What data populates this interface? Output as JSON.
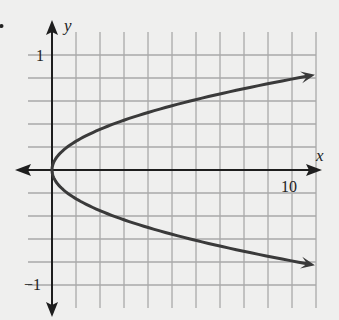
{
  "chart_data": {
    "type": "line",
    "title": "",
    "xlabel": "x",
    "ylabel": "y",
    "equation": "x = 16y^2",
    "xlim": [
      -1,
      11
    ],
    "ylim": [
      -1.2,
      1.2
    ],
    "grid": true,
    "x_grid_step": 1,
    "y_grid_step": 0.2,
    "tick_labels": {
      "x": [
        {
          "value": 10,
          "label": "10"
        }
      ],
      "y": [
        {
          "value": 1,
          "label": "1"
        },
        {
          "value": -1,
          "label": "−1"
        }
      ]
    },
    "series": [
      {
        "name": "upper branch",
        "x": [
          0,
          0.25,
          1,
          2.25,
          4,
          6.25,
          9,
          11
        ],
        "y": [
          0,
          0.125,
          0.25,
          0.375,
          0.5,
          0.625,
          0.75,
          0.83
        ]
      },
      {
        "name": "lower branch",
        "x": [
          0,
          0.25,
          1,
          2.25,
          4,
          6.25,
          9,
          11
        ],
        "y": [
          0,
          -0.125,
          -0.25,
          -0.375,
          -0.5,
          -0.625,
          -0.75,
          -0.83
        ]
      }
    ],
    "arrows": "both branches end with arrowheads; both axes have arrowheads"
  },
  "labels": {
    "x_axis": "x",
    "y_axis": "y",
    "x_tick_10": "10",
    "y_tick_pos1": "1",
    "y_tick_neg1": "−1"
  },
  "colors": {
    "background": "#efefee",
    "grid": "#a9a9a9",
    "axis": "#1e1e1e",
    "curve": "#3a3a3a"
  }
}
